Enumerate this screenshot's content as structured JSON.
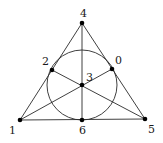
{
  "diagram": {
    "colors": {
      "line": "#2a2a2a",
      "node": "#000000",
      "label": "#1a1a1a",
      "background": "#ffffff"
    },
    "nodes": [
      {
        "id": "0",
        "label": "0",
        "x": 112,
        "y": 69,
        "label_x": 115,
        "label_y": 64
      },
      {
        "id": "1",
        "label": "1",
        "x": 20,
        "y": 120,
        "label_x": 9,
        "label_y": 134
      },
      {
        "id": "2",
        "label": "2",
        "x": 52,
        "y": 70,
        "label_x": 42,
        "label_y": 65
      },
      {
        "id": "3",
        "label": "3",
        "x": 82,
        "y": 85,
        "label_x": 86,
        "label_y": 81
      },
      {
        "id": "4",
        "label": "4",
        "x": 82,
        "y": 23,
        "label_x": 80,
        "label_y": 17
      },
      {
        "id": "5",
        "label": "5",
        "x": 145,
        "y": 119,
        "label_x": 148,
        "label_y": 133
      },
      {
        "id": "6",
        "label": "6",
        "x": 82,
        "y": 120,
        "label_x": 79,
        "label_y": 134
      }
    ],
    "lines": [
      {
        "name": "line-1-2-4",
        "points": [
          "1",
          "2",
          "4"
        ]
      },
      {
        "name": "line-4-0-5",
        "points": [
          "4",
          "0",
          "5"
        ]
      },
      {
        "name": "line-1-6-5",
        "points": [
          "1",
          "6",
          "5"
        ]
      },
      {
        "name": "line-4-3-6",
        "points": [
          "4",
          "3",
          "6"
        ]
      },
      {
        "name": "line-1-3-0",
        "points": [
          "1",
          "3",
          "0"
        ]
      },
      {
        "name": "line-2-3-5",
        "points": [
          "2",
          "3",
          "5"
        ]
      }
    ],
    "circle": {
      "name": "circle-2-0-6",
      "points": [
        "2",
        "0",
        "6"
      ],
      "cx": 82,
      "cy": 85,
      "r": 35
    }
  }
}
